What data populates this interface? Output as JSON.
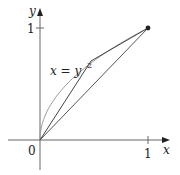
{
  "diagram": {
    "type": "function-plot",
    "curve_label_lhs": "x = y",
    "curve_label_exp": "2",
    "axes": {
      "x_label": "x",
      "y_label": "y",
      "origin_label": "0",
      "x_tick_label": "1",
      "y_tick_label": "1"
    },
    "curve": {
      "equation": "x = y^2",
      "domain_y": [
        0,
        1
      ]
    },
    "polygon_points": [
      [
        0,
        0
      ],
      [
        0.5,
        0.707
      ],
      [
        1,
        1
      ]
    ],
    "chord": [
      [
        0,
        0
      ],
      [
        1,
        1
      ]
    ],
    "endpoint": [
      1,
      1
    ],
    "colors": {
      "axis": "#555555",
      "curve": "#999999",
      "lines": "#444444",
      "text": "#222222"
    }
  }
}
